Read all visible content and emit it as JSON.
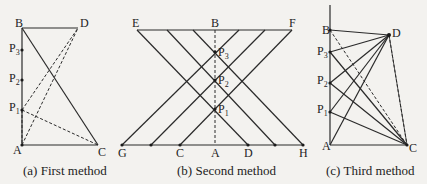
{
  "panels": [
    {
      "id": "a",
      "caption": "(a) First method",
      "points": {
        "B": "B",
        "D": "D",
        "P3": "P",
        "P2": "P",
        "P1": "P",
        "A": "A",
        "C": "C"
      },
      "subs": {
        "P3": "3",
        "P2": "2",
        "P1": "1"
      }
    },
    {
      "id": "b",
      "caption": "(b) Second method",
      "points": {
        "E": "E",
        "B": "B",
        "F": "F",
        "P3": "P",
        "P2": "P",
        "P1": "P",
        "G": "G",
        "C": "C",
        "A": "A",
        "D": "D",
        "H": "H"
      },
      "subs": {
        "P3": "3",
        "P2": "2",
        "P1": "1"
      }
    },
    {
      "id": "c",
      "caption": "(c) Third method",
      "points": {
        "B": "B",
        "D": "D",
        "P3": "P",
        "P2": "P",
        "P1": "P",
        "A": "A",
        "C": "C"
      },
      "subs": {
        "P3": "3",
        "P2": "2",
        "P1": "1"
      }
    }
  ]
}
